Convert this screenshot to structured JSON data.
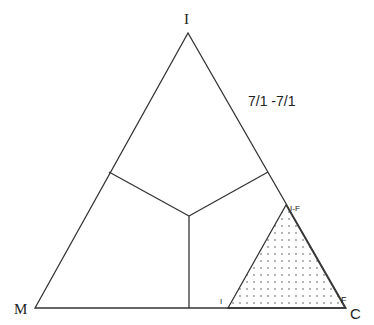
{
  "diagram": {
    "type": "ternary",
    "vertices": {
      "top": "I",
      "left": "M",
      "right": "C"
    },
    "ratio_label": "7/1 -7/1",
    "subregion": {
      "apex_label": "I-F",
      "base_left_label": "I",
      "base_right_label": "F",
      "fill": "dotted"
    },
    "colors": {
      "line": "#333333",
      "background": "#ffffff",
      "dots": "#555555"
    }
  }
}
